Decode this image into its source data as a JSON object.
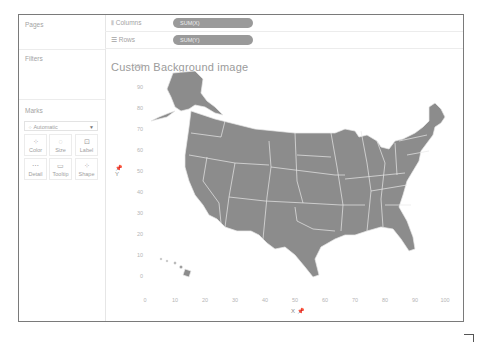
{
  "left_panel": {
    "pages_label": "Pages",
    "filters_label": "Filters",
    "marks_label": "Marks",
    "mark_type": "Automatic",
    "mark_buttons": [
      {
        "label": "Color",
        "icon": "color-dots-icon"
      },
      {
        "label": "Size",
        "icon": "size-icon"
      },
      {
        "label": "Label",
        "icon": "label-icon"
      },
      {
        "label": "Detail",
        "icon": "detail-icon"
      },
      {
        "label": "Tooltip",
        "icon": "tooltip-icon"
      },
      {
        "label": "Shape",
        "icon": "shape-icon"
      }
    ]
  },
  "shelves": {
    "columns_label": "Columns",
    "columns_pill": "SUM(X)",
    "rows_label": "Rows",
    "rows_pill": "SUM(Y)"
  },
  "viz": {
    "title": "Custom Background image",
    "y_axis_title": "Y",
    "x_axis_title": "X",
    "y_ticks": [
      "100",
      "90",
      "80",
      "70",
      "60",
      "50",
      "40",
      "30",
      "20",
      "10",
      "0"
    ],
    "x_ticks": [
      "0",
      "10",
      "20",
      "30",
      "40",
      "50",
      "60",
      "70",
      "80",
      "90",
      "100"
    ],
    "map_color": "#8c8c8c",
    "border_color": "#e8e8e8"
  }
}
